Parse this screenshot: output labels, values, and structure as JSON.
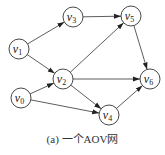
{
  "diagram": {
    "type": "directed-graph",
    "caption": "(a) 一个AOV网",
    "nodes": [
      {
        "id": "v0",
        "base": "v",
        "sub": "0"
      },
      {
        "id": "v1",
        "base": "v",
        "sub": "1"
      },
      {
        "id": "v2",
        "base": "v",
        "sub": "2"
      },
      {
        "id": "v3",
        "base": "v",
        "sub": "3"
      },
      {
        "id": "v4",
        "base": "v",
        "sub": "4"
      },
      {
        "id": "v5",
        "base": "v",
        "sub": "5"
      },
      {
        "id": "v6",
        "base": "v",
        "sub": "6"
      }
    ],
    "edges": [
      {
        "from": "v1",
        "to": "v3"
      },
      {
        "from": "v1",
        "to": "v2"
      },
      {
        "from": "v3",
        "to": "v5"
      },
      {
        "from": "v2",
        "to": "v5"
      },
      {
        "from": "v2",
        "to": "v6"
      },
      {
        "from": "v2",
        "to": "v4"
      },
      {
        "from": "v0",
        "to": "v2"
      },
      {
        "from": "v0",
        "to": "v4"
      },
      {
        "from": "v5",
        "to": "v6"
      },
      {
        "from": "v4",
        "to": "v6"
      }
    ],
    "colors": {
      "stroke": "#333333",
      "text": "#222222",
      "background": "#ffffff"
    }
  }
}
